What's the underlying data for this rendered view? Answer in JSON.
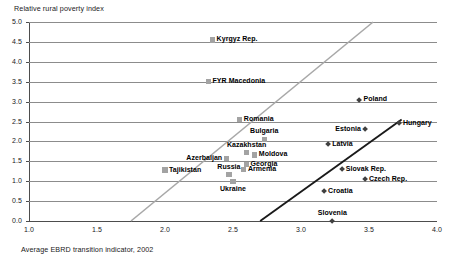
{
  "chart_data": {
    "type": "scatter",
    "title": "",
    "ylabel": "Relative rural poverty index",
    "xlabel": "Average EBRD transition indicator, 2002",
    "xlim": [
      1.0,
      4.0
    ],
    "ylim": [
      0.0,
      5.0
    ],
    "grid": true,
    "legend_position": "none",
    "x_ticks": [
      "1.0",
      "1.5",
      "2.0",
      "2.5",
      "3.0",
      "3.5",
      "4.0"
    ],
    "x_tick_values": [
      1.0,
      1.5,
      2.0,
      2.5,
      3.0,
      3.5,
      4.0
    ],
    "y_ticks": [
      "0.0",
      "0.5",
      "1.0",
      "1.5",
      "2.0",
      "2.5",
      "3.0",
      "3.5",
      "4.0",
      "4.5",
      "5.0"
    ],
    "y_tick_values": [
      0.0,
      0.5,
      1.0,
      1.5,
      2.0,
      2.5,
      3.0,
      3.5,
      4.0,
      4.5,
      5.0
    ],
    "series": [
      {
        "name": "CIS and South-Eastern Europe",
        "marker": "square",
        "color": "#a3a3a3",
        "points": [
          {
            "label": "Kyrgyz Rep.",
            "x": 2.35,
            "y": 4.55,
            "label_pos": "right"
          },
          {
            "label": "FYR Macedonia",
            "x": 2.32,
            "y": 3.5,
            "label_pos": "right"
          },
          {
            "label": "Romania",
            "x": 2.55,
            "y": 2.55,
            "label_pos": "right"
          },
          {
            "label": "Bulgaria",
            "x": 2.73,
            "y": 2.05,
            "label_pos": "above"
          },
          {
            "label": "Kazakhstan",
            "x": 2.6,
            "y": 1.72,
            "label_pos": "above"
          },
          {
            "label": "Moldova",
            "x": 2.66,
            "y": 1.66,
            "label_pos": "right"
          },
          {
            "label": "Azerbaijan",
            "x": 2.45,
            "y": 1.58,
            "label_pos": "left"
          },
          {
            "label": "Georgia",
            "x": 2.6,
            "y": 1.42,
            "label_pos": "right"
          },
          {
            "label": "Armenia",
            "x": 2.58,
            "y": 1.3,
            "label_pos": "right"
          },
          {
            "label": "Tajikistan",
            "x": 2.0,
            "y": 1.28,
            "label_pos": "right"
          },
          {
            "label": "Russia",
            "x": 2.47,
            "y": 1.16,
            "label_pos": "above"
          },
          {
            "label": "Ukraine",
            "x": 2.5,
            "y": 1.0,
            "label_pos": "below"
          }
        ]
      },
      {
        "name": "EU accession countries",
        "marker": "diamond",
        "color": "#404040",
        "points": [
          {
            "label": "Poland",
            "x": 3.43,
            "y": 3.05,
            "label_pos": "right"
          },
          {
            "label": "Hungary",
            "x": 3.72,
            "y": 2.45,
            "label_pos": "right"
          },
          {
            "label": "Estonia",
            "x": 3.47,
            "y": 2.3,
            "label_pos": "left"
          },
          {
            "label": "Latvia",
            "x": 3.2,
            "y": 1.93,
            "label_pos": "right"
          },
          {
            "label": "Slovak Rep.",
            "x": 3.3,
            "y": 1.3,
            "label_pos": "right"
          },
          {
            "label": "Czech Rep.",
            "x": 3.47,
            "y": 1.05,
            "label_pos": "right"
          },
          {
            "label": "Croatia",
            "x": 3.17,
            "y": 0.75,
            "label_pos": "right"
          },
          {
            "label": "Slovenia",
            "x": 3.23,
            "y": 0.0,
            "label_pos": "above"
          }
        ]
      }
    ],
    "trend_lines": [
      {
        "name": "cis-trend-line",
        "color": "#a8a8a8",
        "width": 1.6,
        "x0": 1.75,
        "y0": 0.0,
        "x1": 3.53,
        "y1": 5.0
      },
      {
        "name": "accession-trend-line",
        "color": "#1a1a1a",
        "width": 1.9,
        "x0": 2.7,
        "y0": 0.0,
        "x1": 3.74,
        "y1": 2.55
      }
    ]
  }
}
